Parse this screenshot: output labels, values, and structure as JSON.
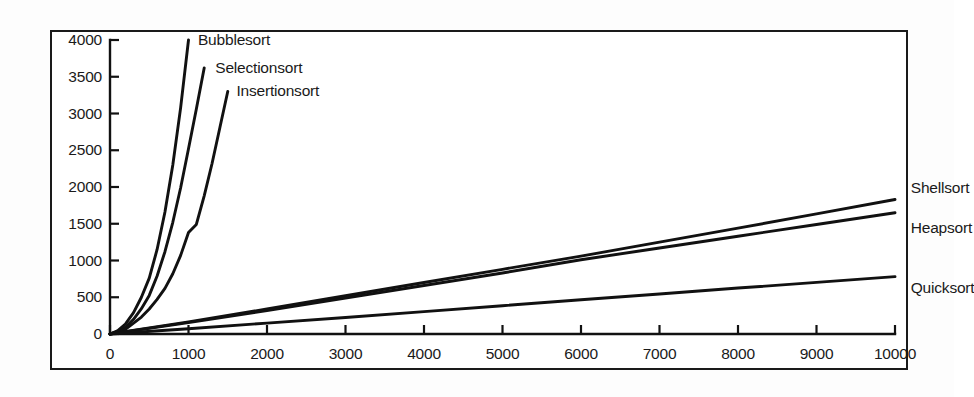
{
  "chart_data": {
    "type": "line",
    "title": "",
    "subtitle": "",
    "xlabel": "",
    "ylabel": "",
    "xlim": [
      0,
      10000
    ],
    "ylim": [
      0,
      4000
    ],
    "grid": false,
    "legend_position": "inline-end-of-line",
    "x_ticks": [
      "0",
      "1000",
      "2000",
      "3000",
      "4000",
      "5000",
      "6000",
      "7000",
      "8000",
      "9000",
      "10000"
    ],
    "x_tick_values": [
      0,
      1000,
      2000,
      3000,
      4000,
      5000,
      6000,
      7000,
      8000,
      9000,
      10000
    ],
    "y_ticks": [
      "0",
      "500",
      "1000",
      "1500",
      "2000",
      "2500",
      "3000",
      "3500",
      "4000"
    ],
    "y_tick_values": [
      0,
      500,
      1000,
      1500,
      2000,
      2500,
      3000,
      3500,
      4000
    ],
    "line_color": "#111111",
    "series": [
      {
        "name": "Bubblesort",
        "label": "Bubblesort",
        "label_x": 1070,
        "label_y": 4000,
        "x": [
          0,
          100,
          200,
          300,
          400,
          500,
          600,
          700,
          800,
          900,
          1000
        ],
        "values": [
          0,
          45,
          140,
          290,
          500,
          760,
          1150,
          1660,
          2300,
          3080,
          4000
        ]
      },
      {
        "name": "Selectionsort",
        "label": "Selectionsort",
        "label_x": 1290,
        "label_y": 3620,
        "x": [
          0,
          100,
          200,
          300,
          400,
          500,
          600,
          700,
          800,
          900,
          1000,
          1100,
          1200
        ],
        "values": [
          0,
          30,
          95,
          200,
          345,
          525,
          790,
          1120,
          1520,
          1990,
          2520,
          3060,
          3620
        ]
      },
      {
        "name": "Insertionsort",
        "label": "Insertionsort",
        "label_x": 1560,
        "label_y": 3300,
        "x": [
          0,
          200,
          400,
          500,
          600,
          700,
          800,
          900,
          1000,
          1100,
          1200,
          1300,
          1400,
          1500
        ],
        "values": [
          0,
          65,
          230,
          340,
          470,
          620,
          820,
          1070,
          1380,
          1490,
          1880,
          2320,
          2810,
          3300
        ]
      },
      {
        "name": "Shellsort",
        "label": "Shellsort",
        "label_x": 10150,
        "label_y": 1980,
        "x": [
          0,
          1000,
          2000,
          3000,
          4000,
          5000,
          6000,
          7000,
          8000,
          9000,
          10000
        ],
        "values": [
          0,
          165,
          340,
          520,
          700,
          880,
          1060,
          1250,
          1440,
          1635,
          1830
        ]
      },
      {
        "name": "Heapsort",
        "label": "Heapsort",
        "label_x": 10150,
        "label_y": 1440,
        "x": [
          0,
          1000,
          2000,
          3000,
          4000,
          5000,
          6000,
          7000,
          8000,
          9000,
          10000
        ],
        "values": [
          0,
          155,
          320,
          490,
          660,
          830,
          1010,
          1170,
          1330,
          1490,
          1650
        ]
      },
      {
        "name": "Quicksort",
        "label": "Quicksort",
        "label_x": 10150,
        "label_y": 620,
        "x": [
          0,
          1000,
          2000,
          3000,
          4000,
          5000,
          6000,
          7000,
          8000,
          9000,
          10000
        ],
        "values": [
          0,
          72,
          148,
          225,
          305,
          385,
          465,
          545,
          625,
          702,
          780
        ]
      }
    ]
  }
}
